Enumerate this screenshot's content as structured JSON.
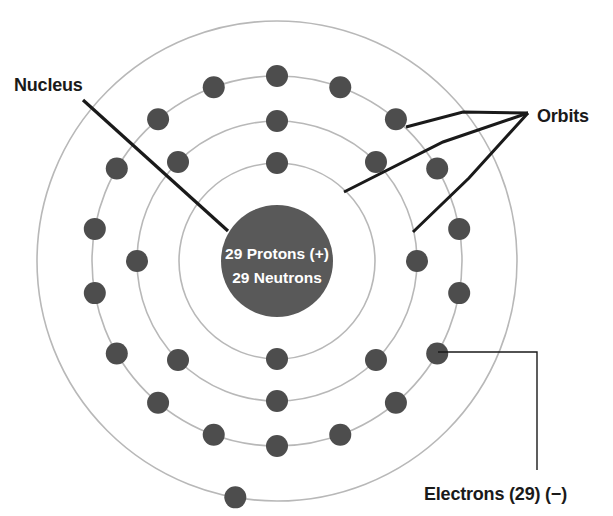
{
  "figure": {
    "background_color": "#ffffff"
  },
  "colors": {
    "orbit_stroke": "#b8b8b8",
    "electron_fill": "#4d4d4d",
    "nucleus_fill": "#595959",
    "leader_line": "#1a1a1a",
    "label_text": "#1a1a1a",
    "nucleus_text": "#ffffff"
  },
  "nucleus": {
    "center_x": 277,
    "center_y": 261,
    "radius": 56,
    "line1": "29 Protons (+)",
    "line2": "29 Neutrons"
  },
  "labels": {
    "nucleus": "Nucleus",
    "orbits": "Orbits",
    "electrons": "Electrons (29) (−)"
  },
  "chart_data": {
    "type": "diagram",
    "element": "Copper",
    "atomic_number": 29,
    "protons": 29,
    "neutrons": 29,
    "electrons_total": 29,
    "shell_occupancy": [
      2,
      8,
      18,
      1
    ],
    "shells": [
      {
        "index": 1,
        "name": "K",
        "radius": 98,
        "electron_count": 2,
        "electron_angles_deg": [
          -90,
          90
        ]
      },
      {
        "index": 2,
        "name": "L",
        "radius": 140,
        "electron_count": 8,
        "electron_angles_deg": [
          -90,
          -45,
          0,
          45,
          90,
          135,
          180,
          225
        ]
      },
      {
        "index": 3,
        "name": "M",
        "radius": 185,
        "electron_count": 18,
        "electron_angles_deg": [
          -90,
          -70,
          -50,
          -30,
          -10,
          10,
          30,
          50,
          70,
          90,
          110,
          130,
          150,
          170,
          190,
          210,
          230,
          250
        ]
      },
      {
        "index": 4,
        "name": "N",
        "radius": 240,
        "electron_count": 1,
        "electron_angles_deg": [
          100
        ]
      }
    ],
    "electron_radius": 11,
    "annotations": [
      {
        "name": "nucleus",
        "text": "Nucleus",
        "text_x": 14,
        "text_y": 91,
        "leader": [
          [
            83,
            100
          ],
          [
            228,
            231
          ]
        ]
      },
      {
        "name": "orbits",
        "text": "Orbits",
        "text_x": 537,
        "text_y": 122,
        "leader_hub": [
          528,
          113
        ],
        "leaders": [
          [
            [
              528,
              113
            ],
            [
              463,
              112
            ],
            [
              406,
              127
            ]
          ],
          [
            [
              528,
              113
            ],
            [
              443,
              142
            ],
            [
              344,
              192
            ]
          ],
          [
            [
              528,
              113
            ],
            [
              469,
              178
            ],
            [
              413,
              232
            ]
          ]
        ]
      },
      {
        "name": "electrons",
        "text": "Electrons (29) (−)",
        "text_x": 424,
        "text_y": 500,
        "leader": [
          [
            438,
            352
          ],
          [
            537,
            352
          ],
          [
            537,
            470
          ]
        ]
      }
    ]
  }
}
